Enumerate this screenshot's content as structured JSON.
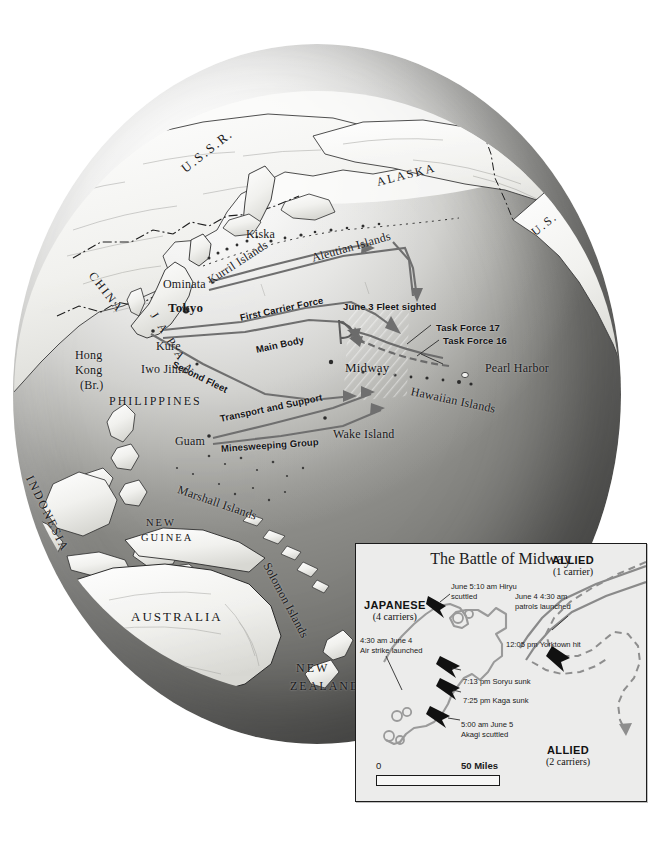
{
  "map": {
    "type": "historical-battle-map",
    "subject": "Battle of Midway, June 1942 — Pacific Theater",
    "globe_labels": [
      {
        "text": "U.S.S.R.",
        "x": 170,
        "y": 118,
        "cls": "lg sp2",
        "rot": -38
      },
      {
        "text": "ALASKA",
        "x": 364,
        "y": 131,
        "cls": "md sp2",
        "rot": -14
      },
      {
        "text": "U.S.",
        "x": 520,
        "y": 182,
        "cls": "md sp2",
        "rot": -38
      },
      {
        "text": "CHINA",
        "x": 78,
        "y": 222,
        "cls": "md sp2",
        "rot": 52
      },
      {
        "text": "Kiska",
        "x": 233,
        "y": 183,
        "cls": "md",
        "rot": 0
      },
      {
        "text": "Ominata",
        "x": 150,
        "y": 233,
        "cls": "md",
        "rot": 0
      },
      {
        "text": "Tokyo",
        "x": 155,
        "y": 256,
        "cls": "lg bold",
        "rot": 0
      },
      {
        "text": "Kure",
        "x": 143,
        "y": 295,
        "cls": "md",
        "rot": 0
      },
      {
        "text": "Iwo Jima",
        "x": 128,
        "y": 318,
        "cls": "md",
        "rot": 0
      },
      {
        "text": "Hong",
        "x": 62,
        "y": 304,
        "cls": "md",
        "rot": 0
      },
      {
        "text": "Kong",
        "x": 62,
        "y": 319,
        "cls": "md",
        "rot": 0
      },
      {
        "text": "(Br.)",
        "x": 67,
        "y": 334,
        "cls": "md",
        "rot": 0
      },
      {
        "text": "PHILIPPINES",
        "x": 96,
        "y": 350,
        "cls": "md sp2",
        "rot": 0
      },
      {
        "text": "Guam",
        "x": 162,
        "y": 390,
        "cls": "md",
        "rot": 0
      },
      {
        "text": "Wake Island",
        "x": 320,
        "y": 383,
        "cls": "md",
        "rot": 0
      },
      {
        "text": "Midway",
        "x": 332,
        "y": 316,
        "cls": "lg",
        "rot": 0
      },
      {
        "text": "Pearl Harbor",
        "x": 472,
        "y": 317,
        "cls": "md",
        "rot": 0
      },
      {
        "text": "AUSTRALIA",
        "x": 118,
        "y": 565,
        "cls": "lg sp2",
        "rot": 0
      },
      {
        "text": "NEW",
        "x": 283,
        "y": 617,
        "cls": "md sp2",
        "rot": 0
      },
      {
        "text": "ZEALAND",
        "x": 277,
        "y": 635,
        "cls": "md sp2",
        "rot": 0
      },
      {
        "text": "NEW",
        "x": 133,
        "y": 473,
        "cls": "sm sp2",
        "rot": 0
      },
      {
        "text": "GUINEA",
        "x": 128,
        "y": 488,
        "cls": "sm sp2",
        "rot": 0
      }
    ],
    "curved_labels": [
      {
        "text": "J A P A N",
        "x": 140,
        "y": 262,
        "rot": 58,
        "cls": "md sp"
      },
      {
        "text": "Kurril Islands",
        "x": 196,
        "y": 230,
        "rot": -33,
        "cls": "md"
      },
      {
        "text": "Aleutian Islands",
        "x": 299,
        "y": 207,
        "rot": -16,
        "cls": "md"
      },
      {
        "text": "Hawaiian Islands",
        "x": 398,
        "y": 340,
        "rot": 12,
        "cls": "md"
      },
      {
        "text": "Marshall Islands",
        "x": 165,
        "y": 438,
        "rot": 19,
        "cls": "md"
      },
      {
        "text": "Solomon Islands",
        "x": 253,
        "y": 512,
        "rot": 62,
        "cls": "md"
      },
      {
        "text": "INDONESIA",
        "x": 16,
        "y": 425,
        "rot": 64,
        "cls": "md sp2"
      }
    ],
    "route_labels": [
      {
        "text": "First Carrier Force",
        "x": 227,
        "y": 268,
        "rot": -12
      },
      {
        "text": "Main Body",
        "x": 243,
        "y": 300,
        "rot": -12
      },
      {
        "text": "Second Fleet",
        "x": 160,
        "y": 314,
        "rot": 26
      },
      {
        "text": "Transport and Support",
        "x": 207,
        "y": 369,
        "rot": -12
      },
      {
        "text": "Minesweeping Group",
        "x": 208,
        "y": 399,
        "rot": -4
      },
      {
        "text": "June 3 Fleet sighted",
        "x": 330,
        "y": 257,
        "rot": 0
      },
      {
        "text": "Task Force 17",
        "x": 423,
        "y": 278,
        "rot": 0
      },
      {
        "text": "Task Force 16",
        "x": 430,
        "y": 291,
        "rot": 0
      }
    ]
  },
  "inset": {
    "title": "The Battle of Midway",
    "forces": [
      {
        "name": "japanese-force",
        "label": "JAPANESE",
        "sub": "(4 carriers)",
        "x": 8,
        "y": 55
      },
      {
        "name": "allied-1-carrier",
        "label": "ALLIED",
        "sub": "(1 carrier)",
        "x": 196,
        "y": 10
      },
      {
        "name": "allied-2-carriers",
        "label": "ALLIED",
        "sub": "(2 carriers)",
        "x": 190,
        "y": 200
      }
    ],
    "events": [
      {
        "name": "hiryu-scuttled",
        "line1": "June 5:10 am",
        "line1b": "Hiryu",
        "line2": "scuttled",
        "x": 95,
        "y": 38
      },
      {
        "name": "air-strike-launched",
        "line1": "4:30 am June 4",
        "line2": "Air strike launched",
        "x": 4,
        "y": 92
      },
      {
        "name": "soryu-sunk",
        "line1": "7:13 pm Soryu sunk",
        "line2": "",
        "x": 107,
        "y": 133
      },
      {
        "name": "kaga-sunk",
        "line1": "7:25 pm Kaga sunk",
        "line2": "",
        "x": 107,
        "y": 152
      },
      {
        "name": "akagi-scuttled",
        "line1": "5:00 am June 5",
        "line2": "Akagi scuttled",
        "x": 105,
        "y": 176
      },
      {
        "name": "patrols-launched",
        "line1": "June 4  4:30 am",
        "line1bold": true,
        "line2": "patrols launched",
        "x": 159,
        "y": 48
      },
      {
        "name": "yorktown-hit",
        "line1": "12:05 pm Yorktown hit",
        "line2": "",
        "x": 150,
        "y": 96
      }
    ],
    "scale": {
      "zero": "0",
      "fifty": "50 Miles",
      "unit": "Miles",
      "max_value": 50
    }
  },
  "colors": {
    "ocean_light": "#d9d9d6",
    "ocean_dark": "#7f7f7b",
    "land": "#f4f4f2",
    "route_arrow": "#6e6e6e",
    "allied_dashed": "#7d7d7d",
    "inset_bg": "#ececeb",
    "ink": "#1a1a1a"
  }
}
